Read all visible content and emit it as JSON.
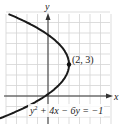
{
  "chart_data": {
    "type": "line",
    "title": "",
    "xlabel": "x",
    "ylabel": "y",
    "equation": "y² + 4x − 6y = −1",
    "curve": "parabola opening left, (y−3)² = −4(x−2)",
    "vertex": {
      "x": 2,
      "y": 3,
      "label": "(2, 3)"
    },
    "xlim": [
      -4.4,
      6.4
    ],
    "ylim": [
      -2.8,
      7.8
    ],
    "grid": true,
    "points": [
      {
        "x": -3.76,
        "y": 7.8
      },
      {
        "x": -2,
        "y": 7.0
      },
      {
        "x": 0,
        "y": 5.83
      },
      {
        "x": 1,
        "y": 5
      },
      {
        "x": 2,
        "y": 3
      },
      {
        "x": 1,
        "y": 1
      },
      {
        "x": 0,
        "y": 0.17
      },
      {
        "x": -2,
        "y": -1
      },
      {
        "x": -3.76,
        "y": -2.1
      }
    ]
  },
  "labels": {
    "x_axis": "x",
    "y_axis": "y",
    "vertex": "(2, 3)",
    "equation_lhs_y": "y",
    "equation_sup": "2",
    "equation_rest": " + 4x − 6y = −1"
  }
}
